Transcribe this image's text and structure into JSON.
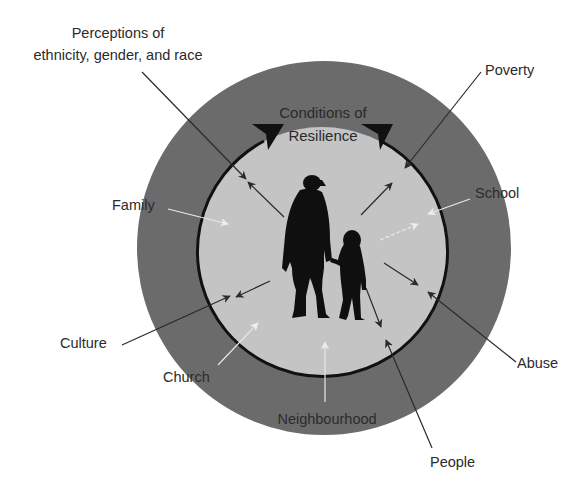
{
  "diagram": {
    "title_line1": "Conditions of",
    "title_line2": "Resilience",
    "colors": {
      "outer_ring": "#6b6b6b",
      "inner_circle": "#c4c4c4",
      "inner_outline": "#111111",
      "dark_arrow": "#2a2a2a",
      "light_arrow": "#e8e8e8",
      "silhouette": "#0f0f0f",
      "text": "#2b2b2b"
    },
    "labels": {
      "perceptions_line1": "Perceptions of",
      "perceptions_line2": "ethnicity, gender, and race",
      "poverty": "Poverty",
      "family": "Family",
      "school": "School",
      "culture": "Culture",
      "church": "Church",
      "abuse": "Abuse",
      "neighbourhood": "Neighbourhood",
      "people": "People"
    },
    "figures": "adult-and-child-silhouette"
  }
}
